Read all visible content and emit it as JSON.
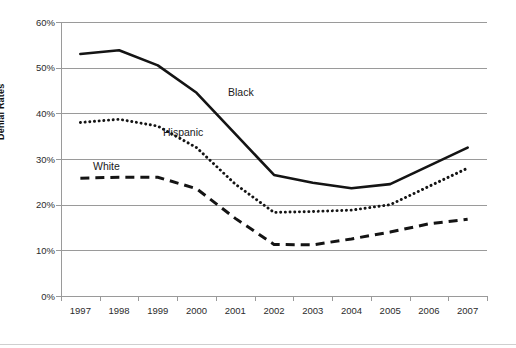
{
  "chart_data": {
    "type": "line",
    "title": "",
    "xlabel": "",
    "ylabel": "Denial Rates",
    "x": [
      1997,
      1998,
      1999,
      2000,
      2001,
      2002,
      2003,
      2004,
      2005,
      2006,
      2007
    ],
    "xtick_labels": [
      "1997",
      "1998",
      "1999",
      "2000",
      "2001",
      "2002",
      "2003",
      "2004",
      "2005",
      "2006",
      "2007"
    ],
    "ytick_labels": [
      "60%",
      "50%",
      "40%",
      "30%",
      "20%",
      "10%",
      "0%"
    ],
    "ytick_values": [
      60,
      50,
      40,
      30,
      20,
      10,
      0
    ],
    "ylim": [
      0,
      60
    ],
    "yunit": "%",
    "grid": "horizontal",
    "legend": "inline-labels",
    "series": [
      {
        "name": "Black",
        "style": "solid",
        "color": "#141414",
        "label_text": "Black",
        "values": [
          53.0,
          53.8,
          50.5,
          44.5,
          35.5,
          26.5,
          24.8,
          23.6,
          24.5,
          28.5,
          32.5
        ]
      },
      {
        "name": "Hispanic",
        "style": "dotted",
        "color": "#141414",
        "label_text": "Hispanic",
        "values": [
          38.0,
          38.7,
          37.2,
          32.5,
          24.5,
          18.3,
          18.5,
          18.8,
          20.0,
          24.0,
          28.0
        ]
      },
      {
        "name": "White",
        "style": "dashed",
        "color": "#141414",
        "label_text": "White",
        "values": [
          25.8,
          26.0,
          26.0,
          23.5,
          17.0,
          11.3,
          11.2,
          12.5,
          14.0,
          15.8,
          16.8
        ]
      }
    ]
  },
  "axis": {
    "y_title": "Denial Rates"
  }
}
